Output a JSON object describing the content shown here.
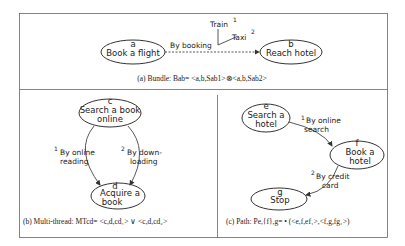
{
  "panels": {
    "bundle": {
      "caption": "(a)  Bundle: Bab= <a,b,Sab1>⊗<a,b,Sab2>",
      "nodes": [
        {
          "id": "a",
          "label": "Book a flight"
        },
        {
          "id": "b",
          "label": "Reach hotel"
        }
      ],
      "edge_label": "By booking",
      "options": [
        {
          "label": "Train",
          "index": "1"
        },
        {
          "label": "Taxi",
          "index": "2"
        }
      ]
    },
    "multithread": {
      "caption": "(b) Multi-thread: MTcd= <c,d,cd₁> ∨ <c,d,cd₂>",
      "nodes": [
        {
          "id": "c",
          "line1": "Search a book",
          "line2": "online"
        },
        {
          "id": "d",
          "line1": "Acquire a",
          "line2": "book"
        }
      ],
      "edges": [
        {
          "index": "1",
          "line1": "By online",
          "line2": "reading"
        },
        {
          "index": "2",
          "line1": "By down-",
          "line2": "loading"
        }
      ]
    },
    "path": {
      "caption": "(c) Path: Pe,{f},g= • (<e,f,ef₁>,<f,g,fg₁>)",
      "nodes": [
        {
          "id": "e",
          "line1": "Search a",
          "line2": "hotel"
        },
        {
          "id": "f",
          "line1": "Book a",
          "line2": "hotel"
        },
        {
          "id": "g",
          "line1": "Stop"
        }
      ],
      "edges": [
        {
          "index": "1",
          "line1": "By online",
          "line2": "search"
        },
        {
          "index": "2",
          "line1": "By credit",
          "line2": "card"
        }
      ]
    }
  },
  "colors": {
    "line": "#444444",
    "frame": "#666666",
    "background": "#ffffff"
  }
}
